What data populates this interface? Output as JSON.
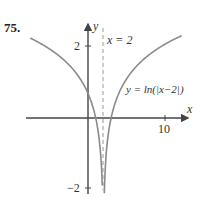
{
  "problem_number": "75.",
  "chart_data": {
    "type": "line",
    "title": "",
    "function_label": "y = ln(|x−2|)",
    "asymptote_label": "x = 2",
    "xlabel": "x",
    "ylabel": "y",
    "x_ticks": [
      {
        "value": 10,
        "label": "10"
      }
    ],
    "y_ticks": [
      {
        "value": 2,
        "label": "2"
      },
      {
        "value": -2,
        "label": "−2"
      }
    ],
    "xlim": [
      -8,
      13
    ],
    "ylim": [
      -2.1,
      2.5
    ],
    "grid": false,
    "vertical_asymptote": 2,
    "series": [
      {
        "name": "y = ln(|x−2|)",
        "x": [
          -7.5,
          -6,
          -4,
          -2,
          0,
          1,
          1.5,
          1.8,
          1.88,
          2.12,
          2.2,
          2.5,
          3,
          4,
          6,
          8,
          10,
          12
        ],
        "y": [
          2.25,
          2.08,
          1.79,
          1.39,
          0.69,
          0,
          -0.69,
          -1.61,
          -2.12,
          -2.12,
          -1.61,
          -0.69,
          0,
          0.69,
          1.39,
          1.79,
          2.08,
          2.3
        ]
      }
    ],
    "colors": {
      "curve": "#8a8a8a",
      "axes": "#444444",
      "asymptote": "#999999"
    }
  }
}
